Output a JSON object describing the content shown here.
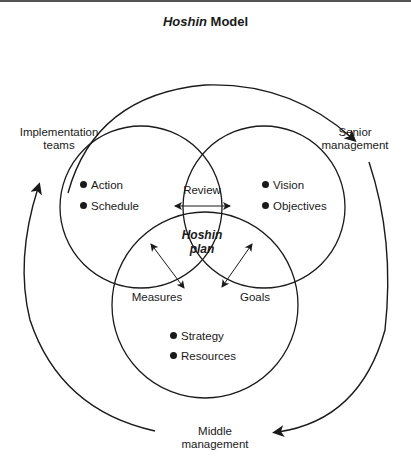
{
  "title": {
    "italic": "Hoshin",
    "rest": " Model"
  },
  "cycle_labels": {
    "implementation": [
      "Implementation",
      "teams"
    ],
    "senior": [
      "Senior",
      "management"
    ],
    "middle": [
      "Middle",
      "management"
    ]
  },
  "circles": {
    "left": {
      "items": [
        "Action",
        "Schedule"
      ]
    },
    "right": {
      "items": [
        "Vision",
        "Objectives"
      ]
    },
    "bottom": {
      "items": [
        "Strategy",
        "Resources"
      ]
    }
  },
  "intersections": {
    "review": "Review",
    "measures": "Measures",
    "goals": "Goals",
    "center": [
      "Hoshin",
      "plan"
    ]
  },
  "colors": {
    "line": "#1a1a1a",
    "background": "#ffffff"
  }
}
